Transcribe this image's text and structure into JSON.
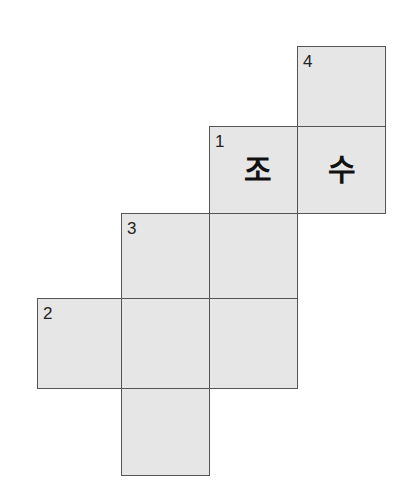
{
  "puzzle": {
    "type": "crossword",
    "colors": {
      "cell_fill": "#e6e6e6",
      "border": "#555555",
      "background": "#ffffff"
    },
    "cells": [
      {
        "row": 0,
        "col": 3,
        "number": "4",
        "char": ""
      },
      {
        "row": 1,
        "col": 2,
        "number": "1",
        "char": "조"
      },
      {
        "row": 1,
        "col": 3,
        "number": "",
        "char": "수"
      },
      {
        "row": 2,
        "col": 1,
        "number": "3",
        "char": ""
      },
      {
        "row": 2,
        "col": 2,
        "number": "",
        "char": ""
      },
      {
        "row": 3,
        "col": 0,
        "number": "2",
        "char": ""
      },
      {
        "row": 3,
        "col": 1,
        "number": "",
        "char": ""
      },
      {
        "row": 3,
        "col": 2,
        "number": "",
        "char": ""
      },
      {
        "row": 4,
        "col": 1,
        "number": "",
        "char": ""
      }
    ]
  }
}
